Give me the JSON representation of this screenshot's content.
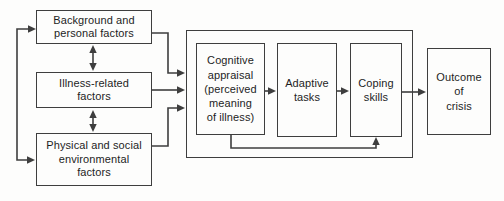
{
  "figure": {
    "background_color": "#fdfdfc",
    "line_color": "#3e3e3e",
    "text_color": "#1e1e1e"
  },
  "diagram": {
    "nodes": {
      "background_factors": "Background and\npersonal factors",
      "illness_factors": "Illness-related\nfactors",
      "environment_factors": "Physical and social\nenvironmental\nfactors",
      "cognitive_appraisal": "Cognitive\nappraisal\n(perceived\nmeaning\nof illness)",
      "adaptive_tasks": "Adaptive\ntasks",
      "coping_skills": "Coping\nskills",
      "outcome_of_crisis": "Outcome\nof\ncrisis"
    },
    "edges": [
      {
        "from": "background_factors",
        "to": "illness_factors",
        "style": "bidirectional"
      },
      {
        "from": "illness_factors",
        "to": "environment_factors",
        "style": "bidirectional"
      },
      {
        "from": "background_factors",
        "to": "environment_factors",
        "style": "bidirectional-left-loop"
      },
      {
        "from": "background_factors",
        "to": "appraisal_panel",
        "style": "arrow"
      },
      {
        "from": "illness_factors",
        "to": "appraisal_panel",
        "style": "arrow"
      },
      {
        "from": "environment_factors",
        "to": "appraisal_panel",
        "style": "arrow"
      },
      {
        "from": "cognitive_appraisal",
        "to": "adaptive_tasks",
        "style": "arrow"
      },
      {
        "from": "adaptive_tasks",
        "to": "coping_skills",
        "style": "arrow"
      },
      {
        "from": "cognitive_appraisal",
        "to": "coping_skills",
        "style": "arrow-feedback-bottom"
      },
      {
        "from": "coping_skills",
        "to": "outcome_of_crisis",
        "style": "arrow"
      }
    ]
  }
}
